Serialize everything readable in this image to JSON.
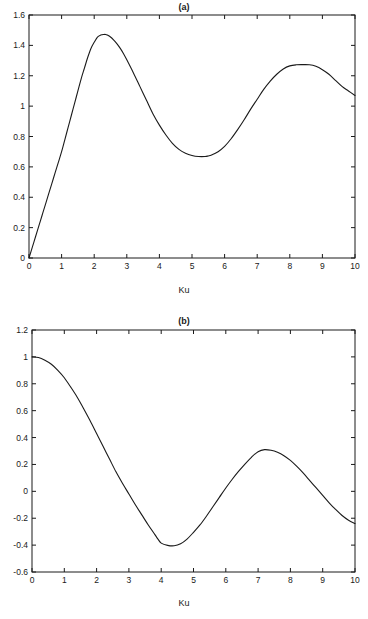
{
  "figure": {
    "panels": [
      {
        "id": "a",
        "title": "(a)",
        "xlabel": "Ku"
      },
      {
        "id": "b",
        "title": "(b)",
        "xlabel": "Ku"
      }
    ]
  },
  "chart_data": [
    {
      "type": "line",
      "title": "(a)",
      "xlabel": "Ku",
      "ylabel": "",
      "xlim": [
        0,
        10
      ],
      "ylim": [
        0,
        1.6
      ],
      "grid": false,
      "legend": null,
      "xticks": [
        0,
        1,
        2,
        3,
        4,
        5,
        6,
        7,
        8,
        9,
        10
      ],
      "xticklabels": [
        "0",
        "1",
        "2",
        "3",
        "4",
        "5",
        "6",
        "7",
        "8",
        "9",
        "10"
      ],
      "yticks": [
        0,
        0.2,
        0.4,
        0.6,
        0.8,
        1,
        1.2,
        1.4,
        1.6
      ],
      "yticklabels": [
        "0",
        "0.2",
        "0.4",
        "0.6",
        "0.8",
        "1",
        "1.2",
        "1.4",
        "1.6"
      ],
      "series": [
        {
          "name": "magnitude",
          "color": "#1a1a1a",
          "x": [
            0,
            0.1,
            0.2,
            0.3,
            0.4,
            0.5,
            0.6,
            0.7,
            0.8,
            0.9,
            1,
            1.1,
            1.2,
            1.3,
            1.4,
            1.5,
            1.6,
            1.7,
            1.8,
            1.9,
            2,
            2.1,
            2.2,
            2.3,
            2.35,
            2.4,
            2.5,
            2.6,
            2.7,
            2.8,
            2.9,
            3,
            3.2,
            3.4,
            3.6,
            3.8,
            4,
            4.2,
            4.4,
            4.6,
            4.8,
            5,
            5.2,
            5.4,
            5.5,
            5.6,
            5.8,
            6,
            6.2,
            6.4,
            6.6,
            6.8,
            7,
            7.2,
            7.4,
            7.6,
            7.8,
            8,
            8.2,
            8.4,
            8.6,
            8.8,
            9,
            9.2,
            9.4,
            9.6,
            9.8,
            10
          ],
          "y": [
            0,
            0.07,
            0.14,
            0.21,
            0.28,
            0.35,
            0.42,
            0.49,
            0.56,
            0.63,
            0.7,
            0.78,
            0.86,
            0.94,
            1.02,
            1.1,
            1.18,
            1.25,
            1.32,
            1.38,
            1.42,
            1.455,
            1.468,
            1.472,
            1.472,
            1.468,
            1.455,
            1.435,
            1.41,
            1.38,
            1.345,
            1.305,
            1.22,
            1.13,
            1.04,
            0.95,
            0.875,
            0.81,
            0.755,
            0.715,
            0.69,
            0.675,
            0.668,
            0.668,
            0.672,
            0.678,
            0.7,
            0.735,
            0.785,
            0.845,
            0.91,
            0.98,
            1.045,
            1.11,
            1.165,
            1.21,
            1.245,
            1.265,
            1.272,
            1.273,
            1.272,
            1.262,
            1.24,
            1.21,
            1.17,
            1.13,
            1.1,
            1.07
          ]
        }
      ]
    },
    {
      "type": "line",
      "title": "(b)",
      "xlabel": "Ku",
      "ylabel": "",
      "xlim": [
        0,
        10
      ],
      "ylim": [
        -0.6,
        1.2
      ],
      "grid": false,
      "legend": null,
      "xticks": [
        0,
        1,
        2,
        3,
        4,
        5,
        6,
        7,
        8,
        9,
        10
      ],
      "xticklabels": [
        "0",
        "1",
        "2",
        "3",
        "4",
        "5",
        "6",
        "7",
        "8",
        "9",
        "10"
      ],
      "yticks": [
        -0.6,
        -0.4,
        -0.2,
        0,
        0.2,
        0.4,
        0.6,
        0.8,
        1,
        1.2
      ],
      "yticklabels": [
        "-0.6",
        "-0.4",
        "-0.2",
        "0",
        "0.2",
        "0.4",
        "0.6",
        "0.8",
        "1",
        "1.2"
      ],
      "series": [
        {
          "name": "real-part",
          "color": "#1a1a1a",
          "x": [
            0,
            0.2,
            0.4,
            0.6,
            0.8,
            1,
            1.2,
            1.4,
            1.6,
            1.8,
            2,
            2.2,
            2.4,
            2.6,
            2.8,
            3,
            3.2,
            3.4,
            3.6,
            3.8,
            3.9,
            4,
            4.2,
            4.4,
            4.6,
            4.8,
            5,
            5.2,
            5.4,
            5.6,
            5.8,
            6,
            6.2,
            6.4,
            6.6,
            6.8,
            7,
            7.2,
            7.4,
            7.6,
            7.8,
            8,
            8.2,
            8.4,
            8.6,
            8.8,
            9,
            9.2,
            9.4,
            9.6,
            9.8,
            10
          ],
          "y": [
            1.0,
            0.995,
            0.975,
            0.945,
            0.9,
            0.845,
            0.775,
            0.7,
            0.615,
            0.525,
            0.43,
            0.335,
            0.24,
            0.145,
            0.06,
            -0.02,
            -0.1,
            -0.175,
            -0.25,
            -0.32,
            -0.355,
            -0.385,
            -0.402,
            -0.405,
            -0.39,
            -0.355,
            -0.305,
            -0.25,
            -0.185,
            -0.115,
            -0.045,
            0.025,
            0.09,
            0.15,
            0.205,
            0.255,
            0.295,
            0.31,
            0.305,
            0.29,
            0.265,
            0.23,
            0.185,
            0.135,
            0.08,
            0.025,
            -0.03,
            -0.085,
            -0.135,
            -0.18,
            -0.215,
            -0.24
          ]
        }
      ]
    }
  ]
}
